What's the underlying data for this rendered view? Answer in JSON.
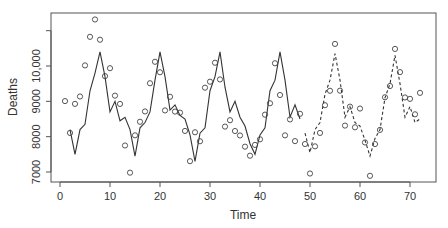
{
  "chart_data": {
    "type": "line",
    "title": "",
    "xlabel": "Time",
    "ylabel": "Deaths",
    "xlim": [
      -2,
      75
    ],
    "ylim": [
      6800,
      11400
    ],
    "xticks": [
      0,
      10,
      20,
      30,
      40,
      50,
      60,
      70
    ],
    "xtick_labels": [
      "0",
      "10",
      "20",
      "30",
      "40",
      "50",
      "60",
      "70"
    ],
    "yticks": [
      7000,
      8000,
      9000,
      10000,
      11000
    ],
    "ytick_labels": [
      "7000",
      "8000",
      "9000",
      "10,000",
      ""
    ],
    "grid": false,
    "legend": null,
    "series": [
      {
        "name": "Observed",
        "style": "points",
        "marker": "open-circle",
        "x": [
          1,
          2,
          3,
          4,
          5,
          6,
          7,
          8,
          9,
          10,
          11,
          12,
          13,
          14,
          15,
          16,
          17,
          18,
          19,
          20,
          21,
          22,
          23,
          24,
          25,
          26,
          27,
          28,
          29,
          30,
          31,
          32,
          33,
          34,
          35,
          36,
          37,
          38,
          39,
          40,
          41,
          42,
          43,
          44,
          45,
          46,
          47,
          48,
          49,
          50,
          51,
          52,
          53,
          54,
          55,
          56,
          57,
          58,
          59,
          60,
          61,
          62,
          63,
          64,
          65,
          66,
          67,
          68,
          69,
          70,
          71,
          72
        ],
        "values": [
          9007,
          8106,
          8928,
          9137,
          10017,
          10826,
          11317,
          10744,
          9713,
          9938,
          9161,
          8927,
          7750,
          6981,
          8038,
          8422,
          8714,
          9512,
          10120,
          9823,
          8743,
          9129,
          8710,
          8680,
          8162,
          7306,
          8124,
          7870,
          9387,
          9556,
          10093,
          9620,
          8285,
          8466,
          8160,
          8034,
          7717,
          7461,
          7767,
          7925,
          8623,
          8945,
          10078,
          9179,
          8037,
          8488,
          7874,
          8647,
          7792,
          6957,
          7726,
          8106,
          8890,
          9299,
          10625,
          9302,
          8314,
          8850,
          8265,
          8796,
          7836,
          6892,
          7791,
          8192,
          9115,
          9434,
          10484,
          9827,
          9110,
          9070,
          8633,
          9240
        ]
      },
      {
        "name": "Fitted",
        "style": "solid-line",
        "x": [
          2,
          3,
          4,
          5,
          6,
          7,
          8,
          9,
          10,
          11,
          12,
          13,
          14,
          15,
          16,
          17,
          18,
          19,
          20,
          21,
          22,
          23,
          24,
          25,
          26,
          27,
          28,
          29,
          30,
          31,
          32,
          33,
          34,
          35,
          36,
          37,
          38,
          39,
          40,
          41,
          42,
          43,
          44,
          45,
          46,
          47,
          48
        ],
        "values": [
          8200,
          7500,
          8200,
          8350,
          9300,
          9800,
          10400,
          9700,
          8700,
          9000,
          8450,
          8550,
          8200,
          7450,
          8250,
          8400,
          8700,
          9600,
          10400,
          9700,
          8750,
          8900,
          8600,
          8500,
          8050,
          7300,
          8100,
          8250,
          9300,
          9700,
          10400,
          9400,
          8700,
          9000,
          8550,
          8300,
          7800,
          7500,
          8050,
          8250,
          9300,
          9600,
          10400,
          9600,
          8550,
          8900,
          8500
        ]
      },
      {
        "name": "Forecast",
        "style": "dashed-line",
        "x": [
          49,
          50,
          51,
          52,
          53,
          54,
          55,
          56,
          57,
          58,
          59,
          60,
          61,
          62,
          63,
          64,
          65,
          66,
          67,
          68,
          69,
          70,
          71,
          72
        ],
        "values": [
          8100,
          7550,
          8200,
          8400,
          9200,
          9600,
          10350,
          9600,
          8550,
          8850,
          8400,
          8300,
          7900,
          7450,
          7950,
          8200,
          9100,
          9500,
          10300,
          9500,
          8550,
          8850,
          8400,
          8500
        ]
      }
    ]
  }
}
